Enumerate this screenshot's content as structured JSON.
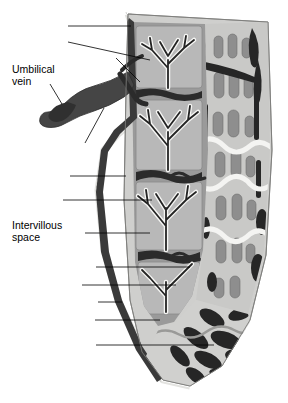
{
  "figure": {
    "background_color": "#ffffff",
    "labels": [
      {
        "id": "amnion",
        "text": "Amnion",
        "x": 62,
        "y": 22,
        "align": "right"
      },
      {
        "id": "septum",
        "text": "Septum",
        "x": 62,
        "y": 38,
        "align": "right"
      },
      {
        "id": "umbilical-arteries",
        "text": "Umbilical arteries",
        "x": 112,
        "y": 54,
        "align": "right"
      },
      {
        "id": "umbilical-vein",
        "text": "Umbilical\nvein",
        "x": 55,
        "y": 72,
        "align": "right"
      },
      {
        "id": "umbilical-cord",
        "text": "Umbilical cord",
        "x": 94,
        "y": 146,
        "align": "right"
      },
      {
        "id": "chorion",
        "text": "Chorion",
        "x": 64,
        "y": 172,
        "align": "right"
      },
      {
        "id": "villus",
        "text": "Villus",
        "x": 57,
        "y": 196,
        "align": "right"
      },
      {
        "id": "intervillous-space",
        "text": "Intervillous\nspace",
        "x": 79,
        "y": 229,
        "align": "right"
      },
      {
        "id": "spiral-arteriole",
        "text": "Spiral arteriole",
        "x": 90,
        "y": 263,
        "align": "right"
      },
      {
        "id": "basal-plate",
        "text": "Basal plate",
        "x": 76,
        "y": 281,
        "align": "right"
      },
      {
        "id": "chorionic-plate",
        "text": "Chorionic plate",
        "x": 92,
        "y": 298,
        "align": "right"
      },
      {
        "id": "endometrium",
        "text": "Endometrium",
        "x": 89,
        "y": 316,
        "align": "right"
      },
      {
        "id": "myometrium",
        "text": "Myometrium",
        "x": 90,
        "y": 341,
        "align": "right"
      }
    ],
    "colors": {
      "amnion": "#f2f2f0",
      "chorion_dark": "#3a3a3a",
      "intervillous": "#9a9a9a",
      "cotyledon": "#b8b8b8",
      "villus_light": "#f5f5f3",
      "villus_dark": "#2e2e2e",
      "endometrium": "#c9c9c7",
      "gland": "#8e8e8e",
      "myometrium": "#d0d0ce",
      "vessel": "#262626",
      "cord": "#454545",
      "leader_line": "#000000",
      "outline": "#6e6e6e"
    }
  }
}
